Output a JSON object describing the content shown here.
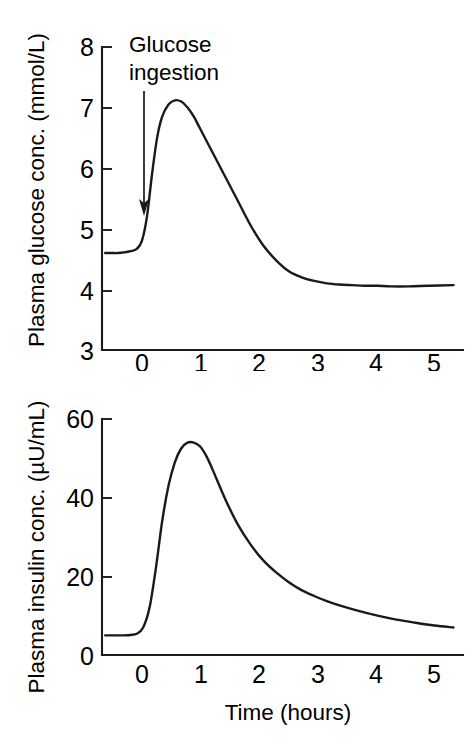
{
  "figure": {
    "background_color": "#ffffff",
    "line_color": "#1a1a1a"
  },
  "chart_data": [
    {
      "type": "line",
      "id": "plasma-glucose",
      "title": "",
      "xlabel": "",
      "ylabel": "Plasma glucose conc. (mmol/L)",
      "xlim": [
        -0.55,
        5.15
      ],
      "ylim": [
        3,
        8
      ],
      "xticks": [
        0,
        1,
        2,
        3,
        4,
        5
      ],
      "xticklabels": [
        "0",
        "1",
        "2",
        "3",
        "4",
        "5"
      ],
      "yticks": [
        3,
        4,
        5,
        6,
        7,
        8
      ],
      "yticklabels": [
        "3",
        "4",
        "5",
        "6",
        "7",
        "8"
      ],
      "grid": false,
      "legend": null,
      "annotations": [
        {
          "text_line1": "Glucose",
          "text_line2": "ingestion",
          "arrow_from_x": 0.0,
          "arrow_from_y": 7.55,
          "arrow_to_x": 0.0,
          "arrow_to_y": 4.9
        }
      ],
      "series": [
        {
          "name": "Plasma glucose",
          "x": [
            -0.5,
            -0.4,
            -0.3,
            -0.2,
            -0.1,
            0.0,
            0.08,
            0.16,
            0.24,
            0.32,
            0.4,
            0.5,
            0.6,
            0.7,
            0.8,
            0.9,
            1.0,
            1.2,
            1.4,
            1.6,
            1.8,
            2.0,
            2.2,
            2.4,
            2.6,
            2.8,
            3.0,
            3.2,
            3.4,
            3.6,
            3.8,
            4.0,
            4.3,
            4.6,
            5.0
          ],
          "y": [
            4.6,
            4.6,
            4.6,
            4.61,
            4.63,
            4.67,
            4.8,
            5.2,
            5.9,
            6.5,
            6.85,
            7.05,
            7.12,
            7.1,
            7.0,
            6.85,
            6.65,
            6.25,
            5.85,
            5.45,
            5.05,
            4.72,
            4.48,
            4.3,
            4.2,
            4.14,
            4.1,
            4.08,
            4.07,
            4.06,
            4.06,
            4.05,
            4.05,
            4.06,
            4.07
          ]
        }
      ]
    },
    {
      "type": "line",
      "id": "plasma-insulin",
      "title": "",
      "xlabel": "Time (hours)",
      "ylabel": "Plasma insulin conc. (µU/mL)",
      "xlim": [
        -0.55,
        5.15
      ],
      "ylim": [
        0,
        60
      ],
      "xticks": [
        0,
        1,
        2,
        3,
        4,
        5
      ],
      "xticklabels": [
        "0",
        "1",
        "2",
        "3",
        "4",
        "5"
      ],
      "yticks": [
        0,
        20,
        40,
        60
      ],
      "yticklabels": [
        "0",
        "20",
        "40",
        "60"
      ],
      "grid": false,
      "legend": null,
      "annotations": [],
      "series": [
        {
          "name": "Plasma insulin",
          "x": [
            -0.5,
            -0.4,
            -0.3,
            -0.2,
            -0.1,
            0.0,
            0.1,
            0.2,
            0.3,
            0.4,
            0.5,
            0.6,
            0.7,
            0.8,
            0.9,
            1.0,
            1.1,
            1.2,
            1.4,
            1.6,
            1.8,
            2.0,
            2.2,
            2.4,
            2.6,
            2.8,
            3.0,
            3.2,
            3.5,
            3.8,
            4.1,
            4.4,
            4.7,
            5.0
          ],
          "y": [
            5.0,
            5.0,
            5.0,
            5.0,
            5.1,
            5.4,
            7.0,
            12.0,
            22.0,
            34.0,
            43.0,
            49.0,
            52.5,
            54.0,
            54.0,
            53.0,
            50.5,
            47.0,
            39.5,
            33.0,
            28.0,
            24.0,
            21.0,
            18.5,
            16.5,
            15.0,
            13.7,
            12.6,
            11.2,
            10.0,
            9.0,
            8.2,
            7.5,
            7.0
          ]
        }
      ]
    }
  ]
}
